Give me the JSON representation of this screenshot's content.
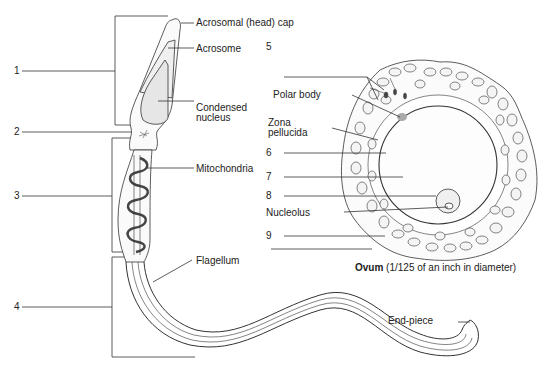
{
  "diagram": {
    "sperm": {
      "numbered_blanks": [
        "1",
        "2",
        "3",
        "4"
      ],
      "labels": {
        "acrosomal_cap": "Acrosomal (head) cap",
        "acrosome": "Acrosome",
        "condensed_nucleus_line1": "Condensed",
        "condensed_nucleus_line2": "nucleus",
        "mitochondria": "Mitochondria",
        "flagellum": "Flagellum",
        "end_piece": "End-piece"
      }
    },
    "ovum": {
      "numbered_blanks": [
        "5",
        "6",
        "7",
        "8",
        "9"
      ],
      "labels": {
        "polar_body": "Polar body",
        "zona_line1": "Zona",
        "zona_line2": "pellucida",
        "nucleolus": "Nucleolus"
      },
      "caption_bold": "Ovum",
      "caption_rest": " (1/125 of an inch in diameter)"
    },
    "colors": {
      "line": "#333333",
      "fill_light": "#eeeeee",
      "cell_fill": "#f4f4f4",
      "polar_body": "#aaaaaa"
    }
  }
}
